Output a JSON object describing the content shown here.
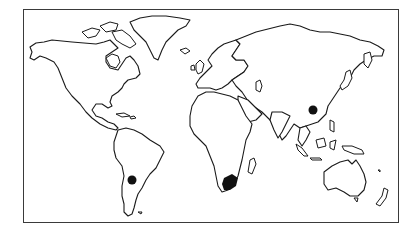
{
  "map": {
    "type": "world-outline-map",
    "projection": "equirectangular-style",
    "frame": {
      "border_color": "#3a3a3a"
    },
    "colors": {
      "land_fill": "#ffffff",
      "coastline": "#1a1a1a",
      "marker": "#111111",
      "background": "#ffffff"
    },
    "markers": [
      {
        "id": "china",
        "label": "Southern China",
        "shape": "dot",
        "x": 313,
        "y": 110,
        "r": 4.5
      },
      {
        "id": "argentina",
        "label": "Northwestern Argentina",
        "shape": "dot",
        "x": 132,
        "y": 180,
        "r": 4.5
      },
      {
        "id": "south-africa",
        "label": "South Africa",
        "shape": "filled-region",
        "x": 232,
        "y": 183
      }
    ]
  }
}
